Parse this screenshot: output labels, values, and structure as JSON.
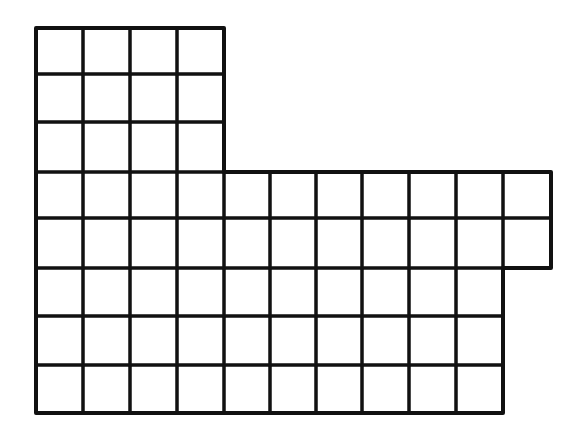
{
  "figure": {
    "line_color": "#111111",
    "background": "#ffffff",
    "x_lines": [
      36,
      83,
      130,
      177,
      224,
      270,
      316,
      362,
      409,
      456,
      503,
      551
    ],
    "y_lines": [
      28,
      74,
      122,
      172,
      218,
      268,
      316,
      365,
      413
    ],
    "row_segments": [
      {
        "rows": [
          0,
          1,
          2
        ],
        "columns": 4
      },
      {
        "rows": [
          3,
          4
        ],
        "columns": 11
      },
      {
        "rows": [
          5,
          6,
          7
        ],
        "columns": 10
      }
    ],
    "total_squares": 64
  }
}
